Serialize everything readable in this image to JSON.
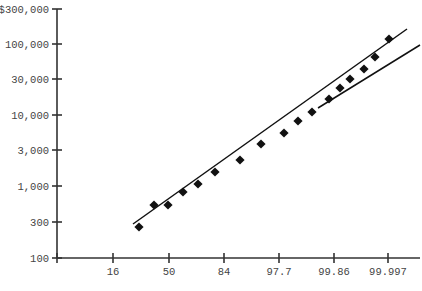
{
  "chart_data": {
    "type": "scatter",
    "title": "",
    "xlabel": "",
    "ylabel": "",
    "x_scale": "probability",
    "y_scale": "log",
    "x_ticks": [
      "16",
      "50",
      "84",
      "97.7",
      "99.86",
      "99.997"
    ],
    "y_ticks": [
      "$300,000",
      "100,000",
      "30,000",
      "10,000",
      "3,000",
      "1,000",
      "300",
      "100"
    ],
    "ylim": [
      100,
      300000
    ],
    "grid": false,
    "legend": null,
    "series": [
      {
        "name": "points",
        "style": "diamond-markers",
        "points_px": [
          [
            139,
            227
          ],
          [
            154,
            205
          ],
          [
            168,
            205
          ],
          [
            183,
            192
          ],
          [
            198,
            184
          ],
          [
            215,
            172
          ],
          [
            240,
            160
          ],
          [
            261,
            144
          ],
          [
            284,
            133
          ],
          [
            298,
            121
          ],
          [
            312,
            112
          ],
          [
            329,
            99
          ],
          [
            340,
            88
          ],
          [
            350,
            79
          ],
          [
            364,
            69
          ],
          [
            375,
            57
          ],
          [
            389,
            39
          ]
        ],
        "values": [
          270,
          550,
          540,
          840,
          1080,
          1600,
          2350,
          3900,
          5600,
          8200,
          11000,
          16700,
          24000,
          32000,
          44000,
          65000,
          115000
        ]
      },
      {
        "name": "fit-line-steep",
        "style": "line",
        "endpoints_px": [
          [
            133,
            224
          ],
          [
            407,
            29
          ]
        ]
      },
      {
        "name": "fit-line-shallow",
        "style": "line",
        "endpoints_px": [
          [
            318,
            108
          ],
          [
            420,
            45
          ]
        ]
      }
    ]
  },
  "axes": {
    "y_tick_px": [
      9,
      44,
      79,
      115,
      150,
      186,
      222,
      258
    ],
    "x_tick_px": [
      113,
      169,
      224,
      279,
      334,
      388
    ],
    "origin_px": [
      57,
      258
    ],
    "x_end_px": 420
  }
}
